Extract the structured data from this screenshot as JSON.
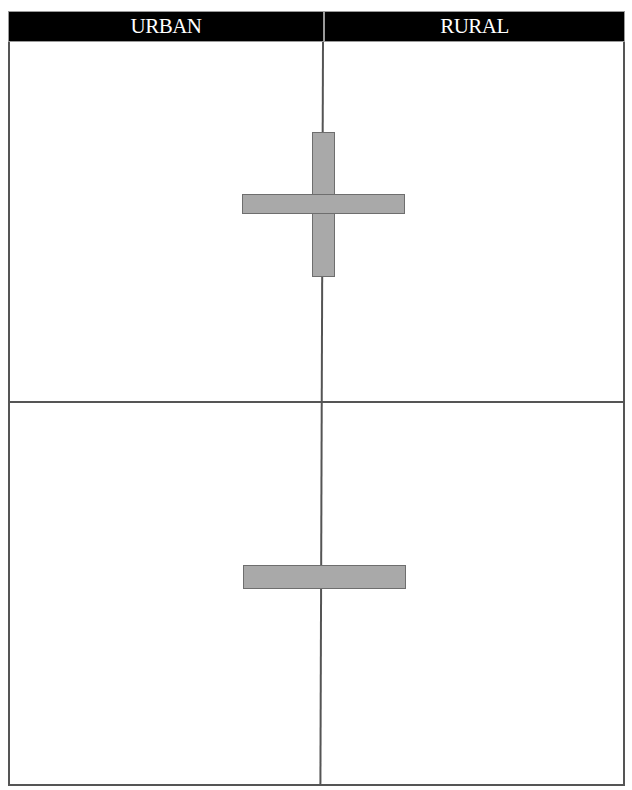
{
  "diagram": {
    "columns": [
      {
        "label": "URBAN"
      },
      {
        "label": "RURAL"
      }
    ],
    "rows": [
      {
        "symbol": "plus",
        "symbol_name": "plus-sign"
      },
      {
        "symbol": "minus",
        "symbol_name": "minus-sign"
      }
    ],
    "colors": {
      "header_bg": "#000000",
      "header_text": "#ffffff",
      "grid_line": "#555555",
      "symbol_fill": "#a9a9a9",
      "symbol_border": "#6e6e6e"
    }
  }
}
